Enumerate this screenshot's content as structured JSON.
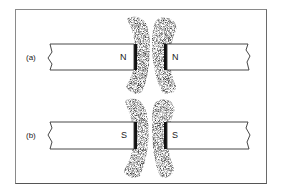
{
  "figure": {
    "rows": [
      {
        "label": "(a)",
        "left_pole": "N",
        "right_pole": "N"
      },
      {
        "label": "(b)",
        "left_pole": "S",
        "right_pole": "S"
      }
    ],
    "colors": {
      "ink": "#1a1a1a",
      "frame": "#8a8a8a",
      "background": "#ffffff"
    }
  }
}
